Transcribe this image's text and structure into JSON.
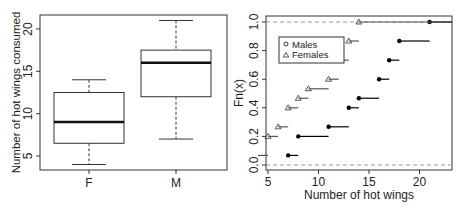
{
  "chart_data": [
    {
      "type": "boxplot",
      "title": "",
      "xlabel": "",
      "ylabel": "Number of hot wings consumed",
      "categories": [
        "F",
        "M"
      ],
      "ylim": [
        3.5,
        22.5
      ],
      "yticks": [
        5,
        10,
        15,
        20
      ],
      "boxes": [
        {
          "name": "F",
          "min": 4,
          "q1": 6.5,
          "median": 9,
          "q3": 12.5,
          "max": 14
        },
        {
          "name": "M",
          "min": 7,
          "q1": 12,
          "median": 16,
          "q3": 17.5,
          "max": 21
        }
      ]
    },
    {
      "type": "line",
      "subtype": "ecdf-step",
      "title": "",
      "xlabel": "Number of hot wings",
      "ylabel": "Fn(x)",
      "xlim": [
        4.8,
        23.3
      ],
      "ylim": [
        0,
        1
      ],
      "xticks": [
        5,
        10,
        15,
        20
      ],
      "yticks": [
        "0.0",
        "0.2",
        "0.4",
        "0.6",
        "0.8",
        "1.0"
      ],
      "legend": {
        "position": "top-left",
        "entries": [
          {
            "label": "Males",
            "marker": "circle"
          },
          {
            "label": "Females",
            "marker": "triangle"
          }
        ]
      },
      "series": [
        {
          "name": "Males",
          "marker": "circle",
          "color": "#000000",
          "x": [
            7,
            8,
            11,
            13,
            14,
            16,
            17,
            18,
            21
          ],
          "y": [
            0.067,
            0.2,
            0.267,
            0.4,
            0.467,
            0.6,
            0.733,
            0.867,
            1.0
          ]
        },
        {
          "name": "Females",
          "marker": "triangle",
          "color": "#555555",
          "x": [
            4,
            5,
            6,
            7,
            8,
            9,
            11,
            12,
            13,
            14
          ],
          "y": [
            0.067,
            0.2,
            0.267,
            0.4,
            0.467,
            0.533,
            0.6,
            0.733,
            0.867,
            1.0
          ]
        }
      ]
    }
  ],
  "labels": {
    "box_ylabel": "Number of hot wings consumed",
    "ecdf_xlabel": "Number of hot wings",
    "ecdf_ylabel": "Fn(x)",
    "legend_males": "Males",
    "legend_females": "Females"
  }
}
